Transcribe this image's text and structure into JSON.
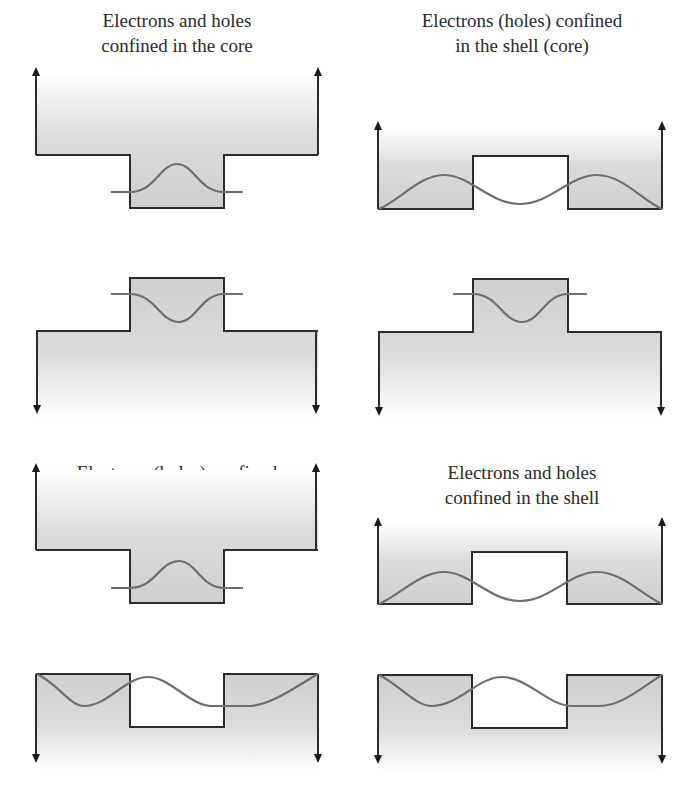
{
  "figure": {
    "panels": [
      {
        "id": "A",
        "title_line1": "Electrons and holes",
        "title_line2": "confined in the core",
        "conduction_band": "core-well",
        "valence_band": "core-well"
      },
      {
        "id": "B",
        "title_line1": "Electrons (holes) confined",
        "title_line2": "in the shell (core)",
        "conduction_band": "shell-well",
        "valence_band": "core-well"
      },
      {
        "id": "C",
        "title_line1": "Electrons (holes) confined",
        "title_line2": "in the core (shell)",
        "conduction_band": "core-well",
        "valence_band": "shell-well"
      },
      {
        "id": "D",
        "title_line1": "Electrons and holes",
        "title_line2": "confined in the shell",
        "conduction_band": "shell-well",
        "valence_band": "shell-well"
      }
    ],
    "colors": {
      "line": "#2b2b2b",
      "wavefunction": "#6e6e6e",
      "fill_dark": "#cfcfcf",
      "fill_light": "#ffffff",
      "text": "#2a2a2a"
    },
    "icons": {
      "arrow_up": "arrow-up-icon",
      "arrow_down": "arrow-down-icon"
    }
  }
}
